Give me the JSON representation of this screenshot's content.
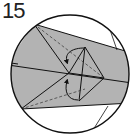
{
  "diagram": {
    "step_number": "15",
    "type": "origami-fold-step",
    "colors": {
      "paper": "#b3b3b3",
      "line": "#111111",
      "background": "#ffffff"
    },
    "annotations": [
      {
        "kind": "valley-fold-arrow",
        "direction": "down-left",
        "position": "upper"
      },
      {
        "kind": "valley-fold-arrow",
        "direction": "up-left",
        "position": "lower"
      },
      {
        "kind": "dashed-line",
        "description": "hidden edge upper flap"
      },
      {
        "kind": "dashed-line",
        "description": "hidden edge lower flap"
      }
    ]
  }
}
